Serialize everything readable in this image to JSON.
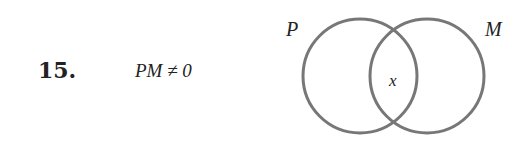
{
  "problem": {
    "number": "15.",
    "expression": "PM ≠ 0"
  },
  "venn": {
    "sets": [
      {
        "label": "P",
        "cx": 360,
        "cy": 76,
        "r": 57
      },
      {
        "label": "M",
        "cx": 427,
        "cy": 76,
        "r": 57
      }
    ],
    "intersection_label": "x",
    "stroke_color": "#777777"
  }
}
